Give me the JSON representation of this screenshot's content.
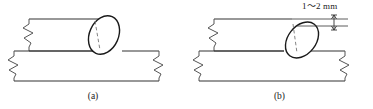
{
  "figure": {
    "type": "technical-line-drawing",
    "background_color": "#ffffff",
    "line_color": "#333333",
    "dashed_line_color": "#666666",
    "panels": [
      {
        "id": "a",
        "caption": "(a)",
        "description": "weld bead seated on top of the upper plate edge, flush with plate corner",
        "bead_shape": "tilted-ellipse",
        "has_dimension": false
      },
      {
        "id": "b",
        "caption": "(b)",
        "description": "weld bead offset below the upper plate edge by the dimensioned gap",
        "bead_shape": "tilted-ellipse",
        "has_dimension": true
      }
    ],
    "dimension": {
      "label": "1～2 mm",
      "min_value": 1,
      "max_value": 2,
      "unit": "mm",
      "separator": "～",
      "applies_to_panel": "b"
    },
    "break_symbol": "zigzag-break-line",
    "break_symbol_count": 4
  }
}
